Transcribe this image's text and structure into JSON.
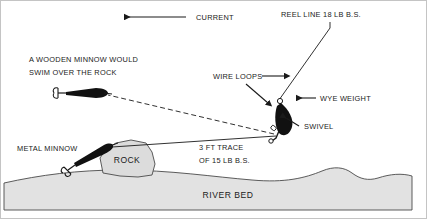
{
  "diagram": {
    "background_color": "#ffffff",
    "border_color": "#bfbfbf",
    "ink_color": "#1a1a1a",
    "riverbed_fill": "#e2e2e2",
    "rock_fill": "#dcdcdc",
    "lure_fill": "#111111"
  },
  "labels": {
    "current": "CURRENT",
    "reel_line": "REEL LINE 18 LB B.S.",
    "wooden_minnow_line1": "A WOODEN MINNOW WOULD",
    "wooden_minnow_line2": "SWIM OVER THE ROCK",
    "wire_loops": "WIRE LOOPS",
    "wye_weight": "WYE WEIGHT",
    "swivel": "SWIVEL",
    "metal_minnow": "METAL MINNOW",
    "trace_line1": "3 FT TRACE",
    "trace_line2": "OF 15 LB B.S.",
    "rock": "ROCK",
    "river_bed": "RIVER BED"
  },
  "icons": {
    "current_arrow": "arrow-left-icon",
    "wire_loops_arrow": "arrow-right-icon",
    "wye_weight_arrow": "arrow-left-icon",
    "swivel_arrow": "arrow-up-left-icon",
    "wire_loops_pointer": "arrow-down-right-icon"
  }
}
